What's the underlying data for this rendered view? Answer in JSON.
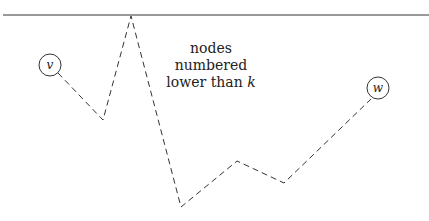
{
  "diagram": {
    "region_label_line1": "nodes numbered",
    "region_label_line2_prefix": "lower than ",
    "region_label_variable": "k",
    "nodes": [
      {
        "id": "v",
        "label": "v",
        "cx": 50,
        "cy": 65,
        "r": 11
      },
      {
        "id": "w",
        "label": "w",
        "cx": 378,
        "cy": 88,
        "r": 11
      }
    ],
    "boundary_line": {
      "x1": 3,
      "y1": 15,
      "x2": 429,
      "y2": 15
    },
    "path_points": "58,73 103,120 131,16 181,207 237,161 284,183 371,99",
    "stroke_color": "#333333"
  }
}
